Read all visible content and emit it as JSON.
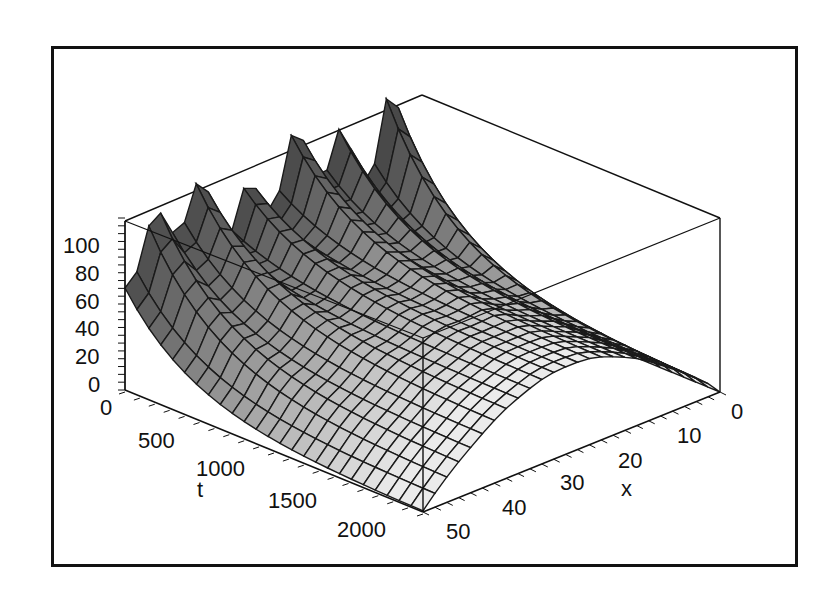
{
  "chart_data": {
    "type": "surface3d",
    "title": "",
    "axes": {
      "x": {
        "label": "x",
        "range": [
          0,
          50
        ],
        "ticks": [
          0,
          10,
          20,
          30,
          40,
          50
        ]
      },
      "t": {
        "label": "t",
        "range": [
          0,
          2000
        ],
        "ticks": [
          0,
          500,
          1000,
          1500,
          2000
        ]
      },
      "z": {
        "label": "",
        "range": [
          0,
          110
        ],
        "ticks": [
          0,
          20,
          40,
          60,
          80,
          100
        ]
      }
    },
    "surface": {
      "description": "Concentration-like field u(x,t): peaks near x=0..50 boundary at t=0 with oscillating spikes (~100-120), decays smoothly to a parabolic profile in x (max ~55 at x≈25-30) as t -> 2000, zero at x=0 and far edge",
      "grid": {
        "x_lines": 26,
        "t_lines": 26
      },
      "initial_spike_peaks_t0": [
        105,
        110,
        112,
        115,
        118,
        125
      ],
      "profile_late_t": {
        "x": [
          0,
          10,
          20,
          30,
          40,
          50
        ],
        "z": [
          0,
          25,
          48,
          55,
          45,
          0
        ]
      },
      "boundary_x0_z": 0,
      "color_scheme": "grayscale (dark at t=0, light toward t=2000)"
    },
    "grid": false,
    "legend": null
  },
  "labels": {
    "z_ticks": [
      "0",
      "20",
      "40",
      "60",
      "80",
      "100"
    ],
    "t_ticks": [
      "0",
      "500",
      "1000",
      "1500",
      "2000"
    ],
    "x_ticks": [
      "0",
      "10",
      "20",
      "30",
      "40",
      "50"
    ],
    "x_axis": "x",
    "t_axis": "t"
  }
}
